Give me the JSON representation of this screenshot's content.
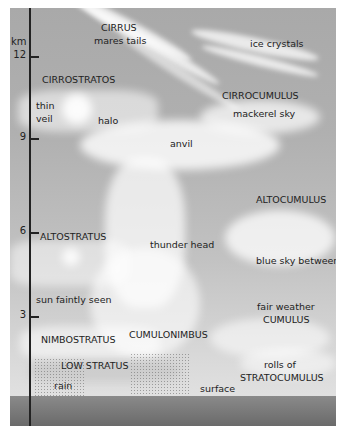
{
  "diagram": {
    "axis": {
      "unit": "km",
      "ticks": [
        {
          "value": "12",
          "y": 48
        },
        {
          "value": "9",
          "y": 130
        },
        {
          "value": "6",
          "y": 224
        },
        {
          "value": "3",
          "y": 308
        }
      ]
    },
    "labels": {
      "cirrus": "CIRRUS",
      "cirrus_sub": "mares tails",
      "ice_crystals": "ice crystals",
      "cirrostratus": "CIRROSTRATOS",
      "thin": "thin",
      "veil": "veil",
      "halo": "halo",
      "cirrocumulus": "CIRROCUMULUS",
      "mackerel_sky": "mackerel sky",
      "anvil": "anvil",
      "altocumulus": "ALTOCUMULUS",
      "altostratus": "ALTOSTRATUS",
      "thunder_head": "thunder head",
      "blue_sky_between": "blue sky between",
      "sun_faintly_seen": "sun faintly seen",
      "fair_weather": "fair weather",
      "cumulus": "CUMULUS",
      "nimbostratus": "NIMBOSTRATUS",
      "cumulonimbus": "CUMULONIMBUS",
      "low_stratus": "LOW STRATUS",
      "rolls_of": "rolls of",
      "stratocumulus": "STRATOCUMULUS",
      "rain": "rain",
      "surface": "surface"
    },
    "colors": {
      "sky_top": "#a9a9a9",
      "sky_bottom": "#e6e6e6",
      "ground": "#6a6a6a",
      "cloud": "#ffffff",
      "text": "#222222"
    }
  }
}
